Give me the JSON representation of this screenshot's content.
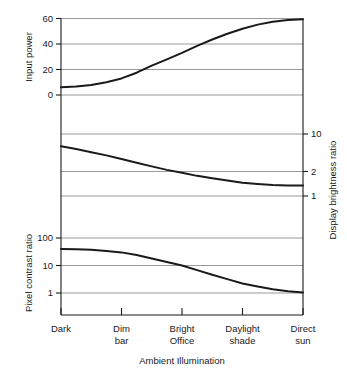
{
  "chart_data": {
    "type": "line",
    "title": "",
    "xlabel": "Ambient Illumination",
    "categories": [
      "Dark",
      "Dim bar",
      "Bright Office",
      "Daylight shade",
      "Direct sun"
    ],
    "category_lines": [
      [
        "Dark",
        ""
      ],
      [
        "Dim",
        "bar"
      ],
      [
        "Bright",
        "Office"
      ],
      [
        "Daylight",
        "shade"
      ],
      [
        "Direct",
        "sun"
      ]
    ],
    "x": [
      0,
      1,
      2,
      3,
      4
    ],
    "grid": true,
    "legend": "none",
    "panels": [
      {
        "name": "input-power",
        "ylabel": "Input power",
        "ylabel_side": "left",
        "scale": "linear",
        "ylim": [
          -8,
          66
        ],
        "yticks": [
          0,
          20,
          40,
          60
        ],
        "ytick_labels": [
          "0",
          "20",
          "40",
          "60"
        ],
        "series": [
          {
            "name": "Input power",
            "values": [
              6,
              13,
              33,
              52,
              59.5
            ],
            "dense_x": [
              0,
              0.25,
              0.5,
              0.75,
              1,
              1.25,
              1.5,
              1.75,
              2,
              2.25,
              2.5,
              2.75,
              3,
              3.25,
              3.5,
              3.75,
              4
            ],
            "dense_values": [
              6,
              6.6,
              7.8,
              10.0,
              13.0,
              17.5,
              23.0,
              28.0,
              33.0,
              38.5,
              43.5,
              48.0,
              52.0,
              55.2,
              57.5,
              58.9,
              59.5
            ]
          }
        ]
      },
      {
        "name": "display-brightness-ratio",
        "ylabel": "Display brightness ratio",
        "ylabel_side": "right",
        "scale": "log",
        "ylim": [
          0.72,
          22
        ],
        "yticks": [
          1,
          2,
          10
        ],
        "ytick_labels": [
          "1",
          "2",
          "10"
        ],
        "series": [
          {
            "name": "Display brightness ratio",
            "values": [
              6.0,
              3.7,
              2.2,
              1.5,
              1.35
            ],
            "dense_x": [
              0,
              0.25,
              0.5,
              0.75,
              1,
              1.25,
              1.5,
              1.75,
              2,
              2.25,
              2.5,
              2.75,
              3,
              3.25,
              3.5,
              3.75,
              4
            ],
            "dense_values": [
              6.0,
              5.4,
              4.8,
              4.25,
              3.7,
              3.2,
              2.8,
              2.45,
              2.2,
              1.95,
              1.78,
              1.63,
              1.5,
              1.43,
              1.38,
              1.355,
              1.35
            ]
          }
        ]
      },
      {
        "name": "pixel-contrast-ratio",
        "ylabel": "Pixel contrast ratio",
        "ylabel_side": "left",
        "scale": "log",
        "ylim": [
          0.45,
          320
        ],
        "yticks": [
          1,
          10,
          100
        ],
        "ytick_labels": [
          "1",
          "10",
          "100"
        ],
        "series": [
          {
            "name": "Pixel contrast ratio",
            "values": [
              40,
              30,
              10,
              2.2,
              1.05
            ],
            "dense_x": [
              0,
              0.25,
              0.5,
              0.75,
              1,
              1.25,
              1.5,
              1.75,
              2,
              2.25,
              2.5,
              2.75,
              3,
              3.25,
              3.5,
              3.75,
              4
            ],
            "dense_values": [
              40,
              39,
              37,
              34,
              30,
              24,
              18,
              13.5,
              10,
              6.8,
              4.6,
              3.2,
              2.2,
              1.72,
              1.38,
              1.15,
              1.05
            ]
          }
        ]
      }
    ]
  },
  "labels": {
    "input_power": "Input power",
    "display_brightness_ratio": "Display brightness ratio",
    "pixel_contrast_ratio": "Pixel contrast ratio",
    "ambient_illumination": "Ambient Illumination",
    "yt_top_0": "0",
    "yt_top_20": "20",
    "yt_top_40": "40",
    "yt_top_60": "60",
    "yt_mid_1": "1",
    "yt_mid_2": "2",
    "yt_mid_10": "10",
    "yt_bot_1": "1",
    "yt_bot_10": "10",
    "yt_bot_100": "100",
    "cat_0_a": "Dark",
    "cat_0_b": "",
    "cat_1_a": "Dim",
    "cat_1_b": "bar",
    "cat_2_a": "Bright",
    "cat_2_b": "Office",
    "cat_3_a": "Daylight",
    "cat_3_b": "shade",
    "cat_4_a": "Direct",
    "cat_4_b": "sun"
  },
  "colors": {
    "curve": "#1a1a1a",
    "grid": "#8d8d8d",
    "axis": "#1a1a1a",
    "background": "#ffffff"
  }
}
